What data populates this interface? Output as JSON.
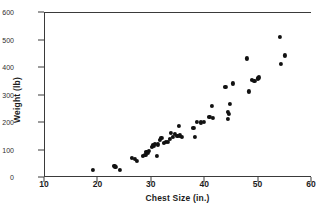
{
  "chart_data": {
    "type": "scatter",
    "title": "",
    "xlabel": "Chest Size (in.)",
    "ylabel": "Weight (lb)",
    "xlim": [
      10,
      60
    ],
    "ylim": [
      0,
      600
    ],
    "xticks": [
      10,
      20,
      30,
      40,
      50,
      60
    ],
    "yticks": [
      0,
      100,
      200,
      300,
      400,
      500,
      600
    ],
    "grid": false,
    "legend": null,
    "marker": "filled-circle",
    "marker_color": "#111111",
    "points": [
      {
        "x": 19.0,
        "y": 30
      },
      {
        "x": 23.0,
        "y": 45
      },
      {
        "x": 23.2,
        "y": 40
      },
      {
        "x": 24.0,
        "y": 30
      },
      {
        "x": 26.2,
        "y": 72
      },
      {
        "x": 26.8,
        "y": 68
      },
      {
        "x": 27.2,
        "y": 62
      },
      {
        "x": 28.3,
        "y": 80
      },
      {
        "x": 28.8,
        "y": 85
      },
      {
        "x": 29.0,
        "y": 95
      },
      {
        "x": 29.2,
        "y": 92
      },
      {
        "x": 29.5,
        "y": 100
      },
      {
        "x": 30.0,
        "y": 112
      },
      {
        "x": 30.2,
        "y": 120
      },
      {
        "x": 30.4,
        "y": 118
      },
      {
        "x": 30.6,
        "y": 125
      },
      {
        "x": 31.0,
        "y": 80
      },
      {
        "x": 31.2,
        "y": 122
      },
      {
        "x": 31.5,
        "y": 140
      },
      {
        "x": 31.8,
        "y": 145
      },
      {
        "x": 32.2,
        "y": 128
      },
      {
        "x": 32.6,
        "y": 132
      },
      {
        "x": 33.0,
        "y": 130
      },
      {
        "x": 33.4,
        "y": 142
      },
      {
        "x": 33.6,
        "y": 165
      },
      {
        "x": 34.0,
        "y": 150
      },
      {
        "x": 34.4,
        "y": 160
      },
      {
        "x": 34.8,
        "y": 152
      },
      {
        "x": 35.0,
        "y": 188
      },
      {
        "x": 35.3,
        "y": 155
      },
      {
        "x": 35.6,
        "y": 150
      },
      {
        "x": 37.8,
        "y": 182
      },
      {
        "x": 38.0,
        "y": 150
      },
      {
        "x": 38.4,
        "y": 205
      },
      {
        "x": 39.2,
        "y": 202
      },
      {
        "x": 39.8,
        "y": 203
      },
      {
        "x": 40.8,
        "y": 222
      },
      {
        "x": 41.2,
        "y": 263
      },
      {
        "x": 41.4,
        "y": 220
      },
      {
        "x": 43.8,
        "y": 332
      },
      {
        "x": 44.2,
        "y": 215
      },
      {
        "x": 44.3,
        "y": 240
      },
      {
        "x": 44.4,
        "y": 232
      },
      {
        "x": 44.6,
        "y": 270
      },
      {
        "x": 45.2,
        "y": 344
      },
      {
        "x": 47.8,
        "y": 435
      },
      {
        "x": 48.2,
        "y": 315
      },
      {
        "x": 48.8,
        "y": 356
      },
      {
        "x": 49.2,
        "y": 352
      },
      {
        "x": 49.8,
        "y": 362
      },
      {
        "x": 50.0,
        "y": 366
      },
      {
        "x": 54.0,
        "y": 514
      },
      {
        "x": 54.2,
        "y": 415
      },
      {
        "x": 55.0,
        "y": 446
      }
    ]
  },
  "axes": {
    "x_tick_labels": [
      "10",
      "20",
      "30",
      "40",
      "50",
      "60"
    ],
    "y_tick_labels": [
      "0",
      "100",
      "200",
      "300",
      "400",
      "500",
      "600"
    ],
    "x_axis_title": "Chest Size (in.)",
    "y_axis_title": "Weight (lb)"
  },
  "colors": {
    "marker": "#111111",
    "axis": "#3a3a3a",
    "text": "#1c1c1c",
    "background": "#ffffff"
  }
}
